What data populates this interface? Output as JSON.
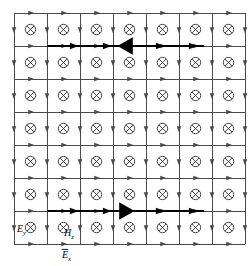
{
  "figure": {
    "type": "yee-grid-field-diagram",
    "background_color": "#ffffff",
    "line_color": "#4a4a4a",
    "bold_color": "#000000",
    "symbol_color": "#333333"
  },
  "grid": {
    "origin_x": 14,
    "origin_y": 13,
    "cell_size": 33,
    "columns": 7,
    "rows": 7,
    "line_width": 1.0,
    "edge_arrow_marker": "right-arrow",
    "vertical_arrow_marker": "down-arrow",
    "cell_center_symbol": "circled-x",
    "cell_center_symbol_meaning": "vector into page",
    "cell_center_radius": 5.2
  },
  "highlighted_rows": [
    {
      "name": "top-bold-row",
      "row_index": 1,
      "y": 46,
      "x_start": 47,
      "x_end": 204,
      "line_width": 2.6,
      "big_arrow": {
        "direction": "left",
        "center_x": 126,
        "size": 11
      },
      "small_arrows_x": [
        74,
        107,
        160,
        193
      ],
      "small_arrow_direction": "right"
    },
    {
      "name": "bottom-bold-row",
      "row_index": 6,
      "y": 211,
      "x_start": 47,
      "x_end": 204,
      "line_width": 2.6,
      "big_arrow": {
        "direction": "right",
        "center_x": 126,
        "size": 11
      },
      "small_arrows_x": [
        74,
        107,
        160,
        193
      ],
      "small_arrow_direction": "right"
    }
  ],
  "labels": {
    "ey": {
      "text": "E",
      "subscript": "y",
      "x": 17,
      "y": 232,
      "overbar": false
    },
    "hz": {
      "text": "H",
      "subscript": "z",
      "x": 64,
      "y": 236,
      "overbar": false
    },
    "ex": {
      "text": "E",
      "subscript": "x",
      "x": 62,
      "y": 258,
      "overbar": true
    }
  },
  "legend_notes": [
    {
      "symbol": "circled-x",
      "meaning": "Hz into page"
    },
    {
      "symbol": "right-arrow",
      "meaning": "Ex along +x"
    },
    {
      "symbol": "down-arrow",
      "meaning": "Ey along -y"
    }
  ]
}
